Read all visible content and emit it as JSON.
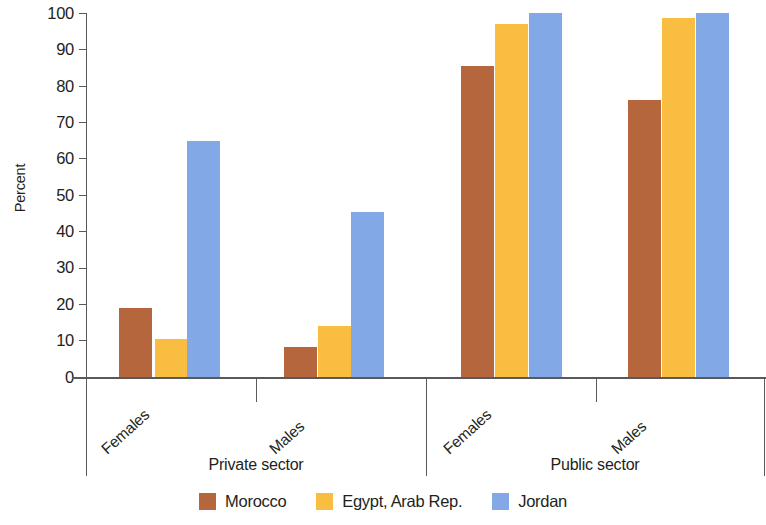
{
  "chart_data": {
    "type": "bar",
    "title": "",
    "xlabel": "",
    "ylabel": "Percent",
    "ylim": [
      0,
      100
    ],
    "yticks": [
      0,
      10,
      20,
      30,
      40,
      50,
      60,
      70,
      80,
      90,
      100
    ],
    "ytick_labels": [
      "0",
      "10",
      "20",
      "30",
      "40",
      "50",
      "60",
      "70",
      "80",
      "90",
      "100"
    ],
    "grid": false,
    "legend_position": "bottom",
    "group_labels": [
      "Private sector",
      "Public sector"
    ],
    "categories": [
      "Females",
      "Males",
      "Females",
      "Males"
    ],
    "series": [
      {
        "name": "Morocco",
        "color": "#b5663c",
        "values": [
          19.0,
          8.3,
          85.5,
          76.0
        ]
      },
      {
        "name": "Egypt, Arab Rep.",
        "color": "#f9bd41",
        "values": [
          10.5,
          14.0,
          97.0,
          98.5
        ]
      },
      {
        "name": "Jordan",
        "color": "#82a8e6",
        "values": [
          64.8,
          45.2,
          100.0,
          100.0
        ]
      }
    ]
  },
  "axes": {
    "y_title": "Percent",
    "y_tick_labels": [
      "100",
      "90",
      "80",
      "70",
      "60",
      "50",
      "40",
      "30",
      "20",
      "10",
      "0"
    ]
  },
  "groups": [
    {
      "sector": "Private sector",
      "categories": [
        "Females",
        "Males"
      ]
    },
    {
      "sector": "Public sector",
      "categories": [
        "Females",
        "Males"
      ]
    }
  ],
  "legend": {
    "items": [
      {
        "label": "Morocco",
        "color": "#b5663c"
      },
      {
        "label": "Egypt, Arab Rep.",
        "color": "#f9bd41"
      },
      {
        "label": "Jordan",
        "color": "#82a8e6"
      }
    ]
  },
  "category_labels": {
    "private_females": "Females",
    "private_males": "Males",
    "public_females": "Females",
    "public_males": "Males"
  },
  "sector_labels": {
    "private": "Private sector",
    "public": "Public sector"
  }
}
